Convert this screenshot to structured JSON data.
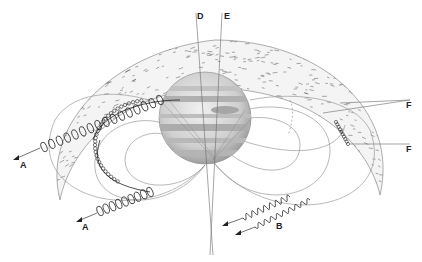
{
  "diagram": {
    "labels": [
      {
        "id": "A",
        "text": "A",
        "description": "radio emission (helical path) escaping to the left"
      },
      {
        "id": "A2",
        "text": "A",
        "description": "second radio emission (helical path) escaping lower-left"
      },
      {
        "id": "B",
        "text": "B",
        "description": "wavy radio emission escaping from lower field lines"
      },
      {
        "id": "C",
        "text": "C",
        "description": "polar axis line"
      },
      {
        "id": "D",
        "text": "D",
        "description": "magnetic axis line"
      },
      {
        "id": "E",
        "text": "E",
        "description": "plasma torus boundaries"
      },
      {
        "id": "F",
        "text": "F",
        "description": "emission source on outer field line"
      }
    ],
    "colors": {
      "background": "#ffffff",
      "planet_light": "#e6e6e6",
      "planet_band": "#a8a8a8",
      "ink": "#222222",
      "field_line": "#9a9a9a"
    }
  }
}
